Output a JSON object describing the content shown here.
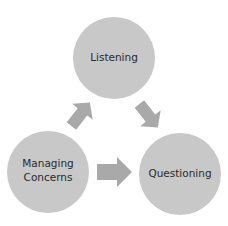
{
  "diagram": {
    "type": "cycle",
    "colors": {
      "circle": "#c8c8c8",
      "arrow": "#a9a9a9",
      "text": "#2a2a2a",
      "background": "#ffffff"
    },
    "nodes": [
      {
        "id": "listening",
        "label_lines": [
          "Listening"
        ]
      },
      {
        "id": "managing-concerns",
        "label_lines": [
          "Managing",
          "Concerns"
        ]
      },
      {
        "id": "questioning",
        "label_lines": [
          "Questioning"
        ]
      }
    ],
    "edges": [
      {
        "from": "managing-concerns",
        "to": "listening"
      },
      {
        "from": "listening",
        "to": "questioning"
      },
      {
        "from": "managing-concerns",
        "to": "questioning"
      }
    ]
  }
}
